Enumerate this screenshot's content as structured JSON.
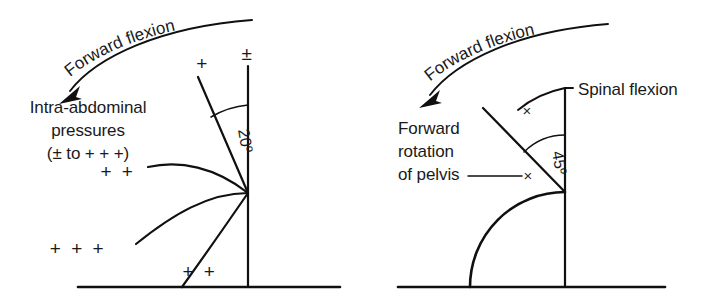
{
  "figure": {
    "background_color": "#ffffff",
    "ink_color": "#101010",
    "panels": [
      {
        "id": "left-panel",
        "name": "intra-abdominal-pressure-panel",
        "curved_arrow_label": "Forward flexion",
        "body_text_lines": [
          "Intra-abdominal",
          "pressures",
          "(± to + + +)"
        ],
        "angle_label": "20º",
        "markers": [
          {
            "name": "plus-single-upper",
            "text": "+",
            "x": 203,
            "y": 70
          },
          {
            "name": "plus-minus-top",
            "text": "±",
            "x": 248,
            "y": 60
          },
          {
            "name": "plus-double-mid",
            "text": "+ +",
            "x": 118,
            "y": 178
          },
          {
            "name": "plus-triple-lower",
            "text": "+ + +",
            "x": 78,
            "y": 255
          },
          {
            "name": "plus-double-bottom",
            "text": "+ +",
            "x": 200,
            "y": 278
          }
        ]
      },
      {
        "id": "right-panel",
        "name": "pelvis-rotation-panel",
        "curved_arrow_label": "Forward flexion",
        "body_text_lines": [
          "Forward",
          "rotation",
          "of pelvis"
        ],
        "callout_label": "Spinal flexion",
        "angle_label": "45º",
        "markers": [
          {
            "name": "x-mark-spinal",
            "text": "×",
            "x": 527,
            "y": 116
          },
          {
            "name": "x-mark-pelvis",
            "text": "×",
            "x": 528,
            "y": 188
          }
        ]
      }
    ]
  }
}
